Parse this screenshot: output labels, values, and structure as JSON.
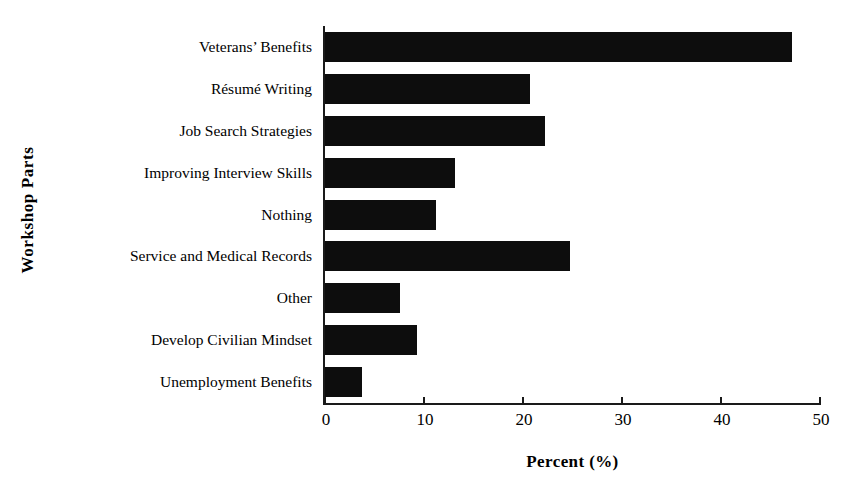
{
  "chart_data": {
    "type": "bar",
    "orientation": "horizontal",
    "title": "",
    "xlabel": "Percent (%)",
    "ylabel": "Workshop Parts",
    "xlim": [
      0,
      50
    ],
    "xticks": [
      0,
      10,
      20,
      30,
      40,
      50
    ],
    "grid": false,
    "legend": null,
    "bar_color": "#0d0d0d",
    "axis_color": "#1a1a1a",
    "background": "#ffffff",
    "categories": [
      "Veterans’ Benefits",
      "Résumé Writing",
      "Job Search Strategies",
      "Improving Interview Skills",
      "Nothing",
      "Service and Medical Records",
      "Other",
      "Develop Civilian Mindset",
      "Unemployment Benefits"
    ],
    "values": [
      47.2,
      20.7,
      22.2,
      13.1,
      11.2,
      24.7,
      7.6,
      9.3,
      3.7
    ]
  }
}
